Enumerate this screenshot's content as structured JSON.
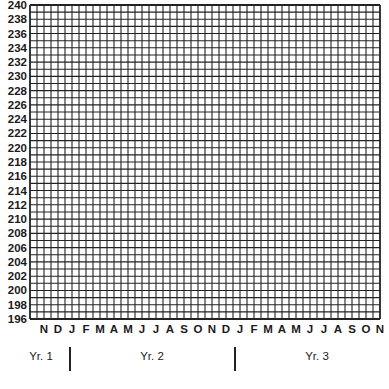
{
  "chart_data": {
    "type": "table",
    "title": "",
    "xlabel": "",
    "ylabel": "",
    "ylim": [
      196,
      240
    ],
    "y_tick_step": 2,
    "y_ticks": [
      240,
      238,
      236,
      234,
      232,
      230,
      228,
      226,
      224,
      222,
      220,
      218,
      216,
      214,
      212,
      210,
      208,
      206,
      204,
      202,
      200,
      198,
      196
    ],
    "y_minor_step": 1,
    "x_ticks": [
      "N",
      "D",
      "J",
      "F",
      "M",
      "A",
      "M",
      "J",
      "J",
      "A",
      "S",
      "O",
      "N",
      "D",
      "J",
      "F",
      "M",
      "A",
      "M",
      "J",
      "J",
      "A",
      "S",
      "O",
      "N"
    ],
    "x_minor_per_month": 2,
    "year_groups": [
      {
        "label": "Yr. 1",
        "months": [
          "N",
          "D"
        ]
      },
      {
        "label": "Yr. 2",
        "months": [
          "J",
          "F",
          "M",
          "A",
          "M",
          "J",
          "J",
          "A",
          "S",
          "O",
          "N",
          "D"
        ]
      },
      {
        "label": "Yr. 3",
        "months": [
          "J",
          "F",
          "M",
          "A",
          "M",
          "J",
          "J",
          "A",
          "S",
          "O",
          "N"
        ]
      }
    ],
    "grid": true,
    "series": []
  },
  "layout": {
    "grid_left": 30,
    "grid_top": 5,
    "grid_right": 380,
    "grid_bottom": 319,
    "cols": 50,
    "rows": 44,
    "line_color": "#222222",
    "background": "#ffffff"
  },
  "labels": {
    "year1": "Yr. 1",
    "year2": "Yr. 2",
    "year3": "Yr. 3"
  }
}
